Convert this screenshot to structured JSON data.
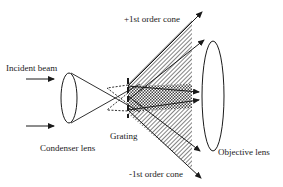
{
  "diagram": {
    "labels": {
      "incident_beam": "Incident beam",
      "condenser_lens": "Condenser lens",
      "grating": "Grating",
      "objective_lens": "Objective lens",
      "plus_first_order": "+1st order cone",
      "minus_first_order": "-1st order cone"
    },
    "colors": {
      "line": "#1a1a1a",
      "background": "#ffffff"
    }
  }
}
